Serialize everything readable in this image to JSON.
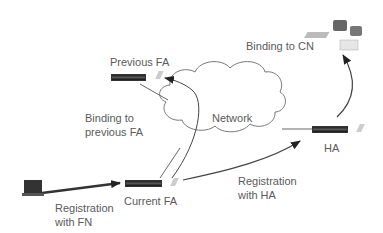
{
  "diagram": {
    "nodes": {
      "previous_fa": {
        "label": "Previous FA",
        "icon": "router-icon"
      },
      "current_fa": {
        "label": "Current FA",
        "icon": "router-icon"
      },
      "ha": {
        "label": "HA",
        "icon": "router-icon"
      },
      "cn": {
        "label": "",
        "icon": "workstation-icon"
      },
      "mobile_node": {
        "label": "",
        "icon": "laptop-icon"
      },
      "network": {
        "label": "Network",
        "icon": "cloud-icon"
      }
    },
    "edges": {
      "registration_fn": {
        "line1": "Registration",
        "line2": "with FN"
      },
      "registration_ha": {
        "line1": "Registration",
        "line2": "with HA"
      },
      "binding_previous": {
        "line1": "Binding to",
        "line2": "previous FA"
      },
      "binding_cn": {
        "label": "Binding to CN"
      }
    },
    "colors": {
      "line": "#444444",
      "arrow": "#222222",
      "text": "#5a5a5a",
      "cloud_stroke": "#777777"
    }
  }
}
